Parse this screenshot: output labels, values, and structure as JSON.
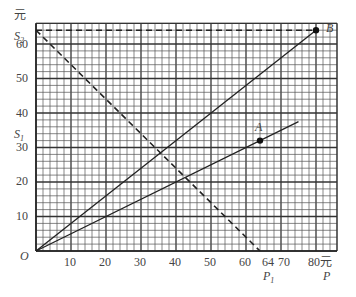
{
  "chart_data": {
    "type": "line",
    "title": "",
    "xlabel": "P (元)",
    "ylabel": "S (元)",
    "xlim": [
      0,
      86
    ],
    "ylim": [
      0,
      66
    ],
    "grid": true,
    "grid_minor_step": 2,
    "grid_major_step": 10,
    "x_ticks": [
      10,
      20,
      30,
      40,
      50,
      60,
      64,
      70,
      80
    ],
    "y_ticks": [
      10,
      20,
      30,
      40,
      50,
      60
    ],
    "series": [
      {
        "name": "OB",
        "style": "solid",
        "points": [
          [
            0,
            0
          ],
          [
            80,
            64
          ]
        ]
      },
      {
        "name": "OA",
        "style": "solid",
        "points": [
          [
            0,
            0
          ],
          [
            75,
            37.5
          ]
        ]
      },
      {
        "name": "S2-P1",
        "style": "dashed",
        "points": [
          [
            0,
            64
          ],
          [
            64,
            0
          ]
        ]
      },
      {
        "name": "S2-B",
        "style": "dashed",
        "points": [
          [
            0,
            64
          ],
          [
            80,
            64
          ]
        ]
      }
    ],
    "annotations": [
      {
        "label": "A",
        "x": 64,
        "y": 32
      },
      {
        "label": "B",
        "x": 80,
        "y": 64
      },
      {
        "label": "S1",
        "axis": "y",
        "value": 32
      },
      {
        "label": "S2",
        "axis": "y",
        "value": 64
      },
      {
        "label": "P1",
        "axis": "x",
        "value": 64
      },
      {
        "label": "P",
        "axis": "x",
        "value": 80
      },
      {
        "label": "O",
        "x": 0,
        "y": 0
      }
    ]
  },
  "labels": {
    "y_unit": "元",
    "x_unit": "元",
    "origin": "O",
    "s1": "S",
    "s1_sub": "1",
    "s2": "S",
    "s2_sub": "2",
    "p1": "P",
    "p1_sub": "1",
    "p": "P",
    "a": "A",
    "b": "B",
    "x_ticks": [
      "10",
      "20",
      "30",
      "40",
      "50",
      "60",
      "64",
      "70",
      "80"
    ],
    "y_ticks": [
      "10",
      "20",
      "30",
      "40",
      "50",
      "60"
    ]
  }
}
